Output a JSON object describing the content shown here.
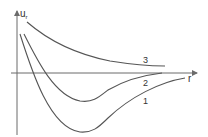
{
  "diagram": {
    "type": "potential-energy-curves",
    "y_axis": {
      "label": "u",
      "subscript": "r"
    },
    "x_axis": {
      "label": "r"
    },
    "curves": [
      {
        "id": "1",
        "label": "1",
        "description": "deepest well"
      },
      {
        "id": "2",
        "label": "2",
        "description": "shallow well"
      },
      {
        "id": "3",
        "label": "3",
        "description": "purely repulsive"
      }
    ],
    "colors": {
      "axis": "#6b6b6b",
      "curve": "#555555",
      "text": "#333333"
    }
  }
}
